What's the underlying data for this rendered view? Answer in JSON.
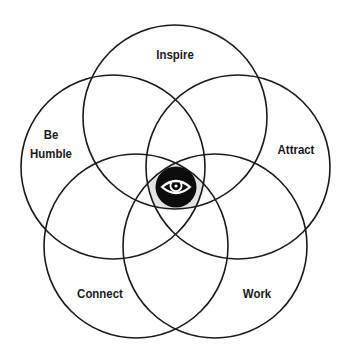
{
  "diagram": {
    "type": "five-circle venn / flower diagram",
    "center_icon": "eye-icon",
    "colors": {
      "stroke": "#1a1a1a",
      "background": "#ffffff",
      "center_fill": "#e4e4e4",
      "icon_disc": "#0d0d0d",
      "icon_glyph": "#ffffff"
    },
    "circles": [
      {
        "id": "inspire",
        "label": "Inspire",
        "cx": 175,
        "cy": 117,
        "r": 92
      },
      {
        "id": "be-humble",
        "label_line1": "Be",
        "label_line2": "Humble",
        "cx": 113,
        "cy": 167,
        "r": 92
      },
      {
        "id": "attract",
        "label": "Attract",
        "cx": 238,
        "cy": 167,
        "r": 92
      },
      {
        "id": "connect",
        "label": "Connect",
        "cx": 136,
        "cy": 246,
        "r": 92
      },
      {
        "id": "work",
        "label": "Work",
        "cx": 215,
        "cy": 246,
        "r": 92
      }
    ]
  }
}
